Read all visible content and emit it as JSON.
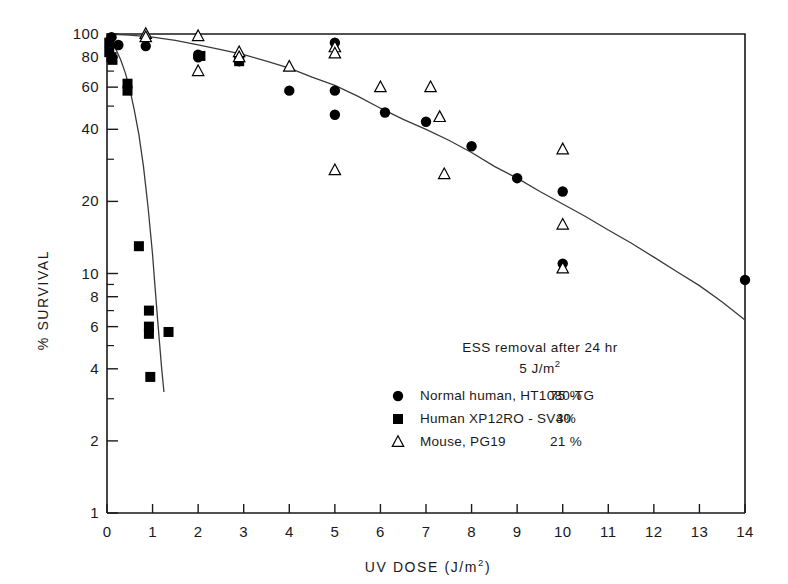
{
  "chart_data": {
    "type": "scatter",
    "title": "",
    "xlabel": "UV DOSE (J/m2)",
    "xlabel_base": "UV  DOSE  (J/m",
    "xlabel_sup": "2",
    "xlabel_tail": ")",
    "ylabel": "% SURVIVAL",
    "yscale": "log",
    "ylim": [
      1,
      100
    ],
    "xlim": [
      0,
      14
    ],
    "grid": false,
    "legend_position": "lower-right-inside",
    "xticks": [
      0,
      1,
      2,
      3,
      4,
      5,
      6,
      7,
      8,
      9,
      10,
      11,
      12,
      13,
      14
    ],
    "xticklabels": [
      "0",
      "1",
      "2",
      "3",
      "4",
      "5",
      "6",
      "7",
      "8",
      "9",
      "10",
      "11",
      "12",
      "13",
      "14"
    ],
    "yticks": [
      1,
      2,
      4,
      6,
      8,
      10,
      20,
      40,
      60,
      80,
      100
    ],
    "yticklabels": [
      "1",
      "2",
      "4",
      "6",
      "8",
      "10",
      "20",
      "40",
      "60",
      "80",
      "100"
    ],
    "yminorticks": [
      3,
      5,
      7,
      9,
      30,
      50,
      70,
      90
    ],
    "series": [
      {
        "name": "Normal human, HT1080-TG",
        "marker": "filled-circle",
        "color": "#000000",
        "points": [
          [
            0.1,
            97
          ],
          [
            0.25,
            90
          ],
          [
            0.85,
            89
          ],
          [
            2.0,
            82
          ],
          [
            2.0,
            80
          ],
          [
            2.9,
            77
          ],
          [
            4.0,
            58
          ],
          [
            5.0,
            92
          ],
          [
            5.0,
            58
          ],
          [
            5.0,
            46
          ],
          [
            6.1,
            47
          ],
          [
            7.0,
            43
          ],
          [
            8.0,
            34
          ],
          [
            9.0,
            25
          ],
          [
            10.0,
            22
          ],
          [
            10.0,
            11
          ],
          [
            14.0,
            9.4
          ]
        ]
      },
      {
        "name": "Human XP12RO-SV40",
        "marker": "filled-square",
        "color": "#000000",
        "points": [
          [
            0.05,
            92
          ],
          [
            0.05,
            84
          ],
          [
            0.1,
            80
          ],
          [
            0.12,
            78
          ],
          [
            0.45,
            62
          ],
          [
            0.45,
            58
          ],
          [
            0.7,
            13
          ],
          [
            0.92,
            7.0
          ],
          [
            0.92,
            6.0
          ],
          [
            0.92,
            5.6
          ],
          [
            1.35,
            5.7
          ],
          [
            0.95,
            3.7
          ],
          [
            2.05,
            81
          ],
          [
            2.9,
            77
          ]
        ]
      },
      {
        "name": "Mouse, PG19",
        "marker": "open-triangle",
        "color": "#000000",
        "points": [
          [
            0.85,
            100
          ],
          [
            0.85,
            97
          ],
          [
            2.0,
            98
          ],
          [
            2.0,
            70
          ],
          [
            2.9,
            84
          ],
          [
            2.9,
            80
          ],
          [
            4.0,
            73
          ],
          [
            5.0,
            88
          ],
          [
            5.0,
            83
          ],
          [
            5.0,
            27
          ],
          [
            6.0,
            60
          ],
          [
            7.1,
            60
          ],
          [
            7.3,
            45
          ],
          [
            7.4,
            26
          ],
          [
            10.0,
            33
          ],
          [
            10.0,
            16
          ],
          [
            10.0,
            10.5
          ]
        ]
      }
    ],
    "fit_curves": [
      {
        "name": "normal-human-fit",
        "points": [
          [
            0.0,
            100
          ],
          [
            0.5,
            99
          ],
          [
            1.0,
            97
          ],
          [
            1.5,
            94
          ],
          [
            2.0,
            90
          ],
          [
            2.5,
            86
          ],
          [
            3.0,
            82
          ],
          [
            3.5,
            77
          ],
          [
            4.0,
            72
          ],
          [
            4.5,
            66
          ],
          [
            5.0,
            61
          ],
          [
            5.5,
            55
          ],
          [
            6.0,
            49
          ],
          [
            6.5,
            44
          ],
          [
            7.0,
            40
          ],
          [
            7.5,
            36
          ],
          [
            8.0,
            32
          ],
          [
            8.5,
            28
          ],
          [
            9.0,
            25
          ],
          [
            9.5,
            22
          ],
          [
            10.0,
            19.5
          ],
          [
            10.5,
            17.3
          ],
          [
            11.0,
            15.2
          ],
          [
            11.5,
            13.4
          ],
          [
            12.0,
            11.7
          ],
          [
            12.5,
            10.2
          ],
          [
            13.0,
            8.9
          ],
          [
            13.5,
            7.6
          ],
          [
            14.0,
            6.4
          ]
        ]
      },
      {
        "name": "xp-human-fit",
        "points": [
          [
            0.0,
            100
          ],
          [
            0.1,
            93
          ],
          [
            0.2,
            86
          ],
          [
            0.3,
            78
          ],
          [
            0.4,
            69
          ],
          [
            0.5,
            59
          ],
          [
            0.6,
            48
          ],
          [
            0.7,
            38
          ],
          [
            0.8,
            28
          ],
          [
            0.9,
            19
          ],
          [
            1.0,
            12
          ],
          [
            1.05,
            9.0
          ],
          [
            1.1,
            6.8
          ],
          [
            1.15,
            5.2
          ],
          [
            1.2,
            4.0
          ],
          [
            1.25,
            3.2
          ]
        ]
      }
    ],
    "annotation": {
      "line1": "ESS removal after  24 hr",
      "line2_base": "5 J/m",
      "line2_sup": "2"
    },
    "legend": [
      {
        "marker": "filled-circle",
        "label": "Normal human, HT1080-TG",
        "value": "75 %"
      },
      {
        "marker": "filled-square",
        "label": "Human  XP12RO - SV40",
        "value": "3%"
      },
      {
        "marker": "open-triangle",
        "label": "Mouse, PG19",
        "value": "21 %"
      }
    ]
  }
}
